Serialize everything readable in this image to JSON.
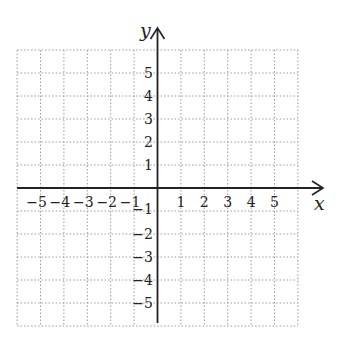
{
  "chart_data": {
    "type": "scatter",
    "title": "",
    "xlabel": "x",
    "ylabel": "y",
    "xlim": [
      -6,
      6
    ],
    "ylim": [
      -6,
      6
    ],
    "grid": true,
    "grid_style": "dotted",
    "x_ticks": [
      -5,
      -4,
      -3,
      -2,
      -1,
      1,
      2,
      3,
      4,
      5
    ],
    "y_ticks": [
      -5,
      -4,
      -3,
      -2,
      -1,
      1,
      2,
      3,
      4,
      5
    ],
    "x_tick_labels": [
      "−5",
      "−4",
      "−3",
      "−2",
      "−1",
      "1",
      "2",
      "3",
      "4",
      "5"
    ],
    "y_tick_labels": [
      "−5",
      "−4",
      "−3",
      "−2",
      "−1",
      "1",
      "2",
      "3",
      "4",
      "5"
    ],
    "series": [],
    "colors": {
      "axis": "#222222",
      "grid": "#9a9a9a",
      "background": "#ffffff"
    }
  }
}
